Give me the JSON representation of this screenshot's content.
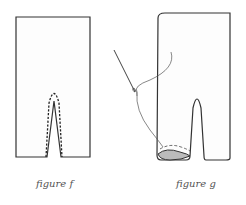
{
  "figures": [
    {
      "id": "f",
      "caption": "figure f",
      "description": "Rectangular fabric piece with a center slit from the bottom edge and a dashed stitching line around the slit"
    },
    {
      "id": "g",
      "caption": "figure g",
      "description": "Trouser-shaped piece with two legs; a needle and thread hand-stitching the hem of the left leg opening"
    }
  ],
  "colors": {
    "line": "#333333",
    "thread": "#555555",
    "fill": "#fdfdfd",
    "hem_shading": "#bbbbbb"
  }
}
